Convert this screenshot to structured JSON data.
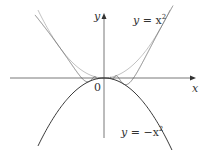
{
  "chart_data": {
    "type": "line",
    "title": "",
    "xlabel": "x",
    "ylabel": "y",
    "origin_label": "0",
    "grid": false,
    "legend": "none",
    "series": [
      {
        "name": "y = x^2",
        "label": "y = x²",
        "color": "#bbbbbb",
        "expr": "x^2"
      },
      {
        "name": "y = -x^2",
        "label": "y = −x²",
        "color": "#222222",
        "expr": "-x^2"
      },
      {
        "name": "y = x^2 sin(1/x)",
        "label": "",
        "color": "#555555",
        "expr": "x^2*sin(1/x)"
      }
    ],
    "annotations": [
      {
        "text": "y = x²",
        "position": "upper right"
      },
      {
        "text": "y = −x²",
        "position": "lower right"
      },
      {
        "text": "0",
        "position": "origin"
      }
    ],
    "pixel_model": {
      "origin": [
        104,
        78
      ],
      "k": 0.0156,
      "c_right": 92.7,
      "c_left": 70,
      "x_range_px": [
        35,
        173
      ]
    }
  },
  "labels": {
    "x_axis": "x",
    "y_axis": "y",
    "origin": "0",
    "upper_curve_y": "y",
    "upper_curve_eq": " = x",
    "upper_curve_exp": "2",
    "lower_curve_y": "y",
    "lower_curve_eq": " = −x",
    "lower_curve_exp": "2"
  }
}
